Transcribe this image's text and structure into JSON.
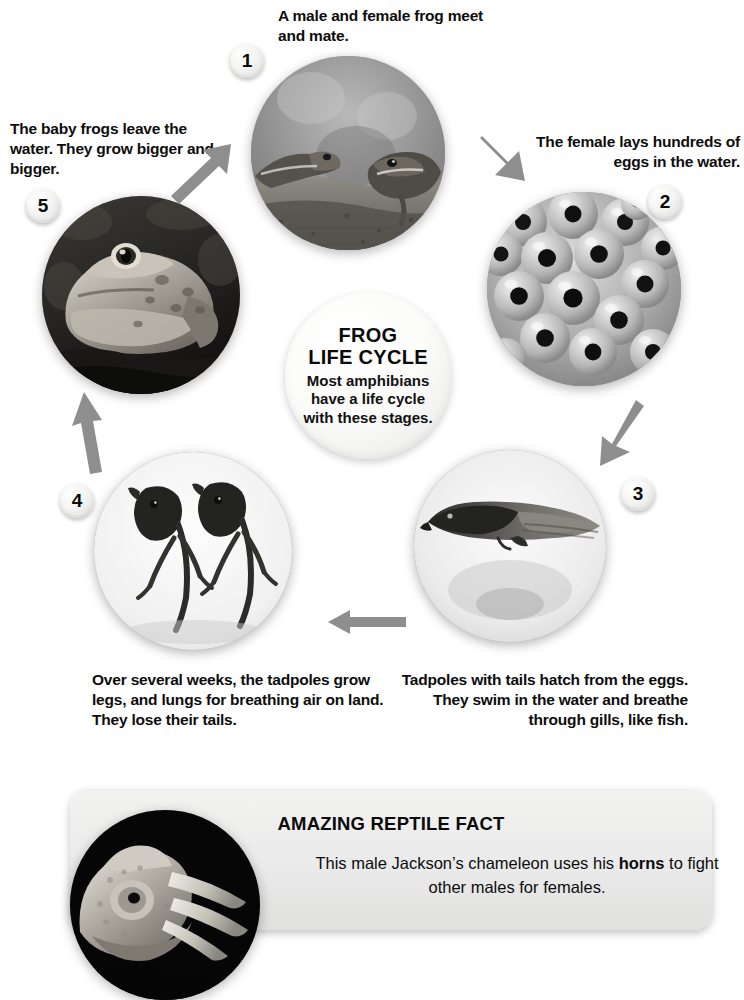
{
  "diagram": {
    "hub": {
      "title_line1": "FROG",
      "title_line2": "LIFE CYCLE",
      "subtitle": "Most amphibians have a life cycle with these stages."
    },
    "stages": [
      {
        "number": "1",
        "caption": "A male and female frog meet and mate.",
        "image_name": "two-frogs-mating-photo"
      },
      {
        "number": "2",
        "caption": "The female lays hundreds of eggs in the water.",
        "image_name": "frog-eggs-photo"
      },
      {
        "number": "3",
        "caption": "Tadpoles with tails hatch from the eggs. They swim in the water and breathe through gills, like fish.",
        "image_name": "tadpole-photo"
      },
      {
        "number": "4",
        "caption": "Over several weeks, the tadpoles grow legs, and lungs for breathing air on land. They lose their tails.",
        "image_name": "tadpoles-with-legs-photo"
      },
      {
        "number": "5",
        "caption": "The baby frogs leave the water. They grow bigger and bigger.",
        "image_name": "adult-frog-photo"
      }
    ],
    "arrows": [
      {
        "name": "arrow-stage5-to-stage1",
        "direction": "up-right"
      },
      {
        "name": "arrow-stage1-to-stage2",
        "direction": "down-right"
      },
      {
        "name": "arrow-stage2-to-stage3",
        "direction": "down-left"
      },
      {
        "name": "arrow-stage3-to-stage4",
        "direction": "left"
      },
      {
        "name": "arrow-stage4-to-stage5",
        "direction": "up"
      }
    ]
  },
  "fact_panel": {
    "title": "AMAZING REPTILE FACT",
    "body_before": "This male Jackson’s chameleon uses his ",
    "body_bold": "horns",
    "body_after": " to fight other males for females.",
    "image_name": "jacksons-chameleon-photo"
  },
  "colors": {
    "arrow_gray": "#8c8c8c",
    "panel_gray": "#eaeaea",
    "text_black": "#0d0d0d"
  }
}
